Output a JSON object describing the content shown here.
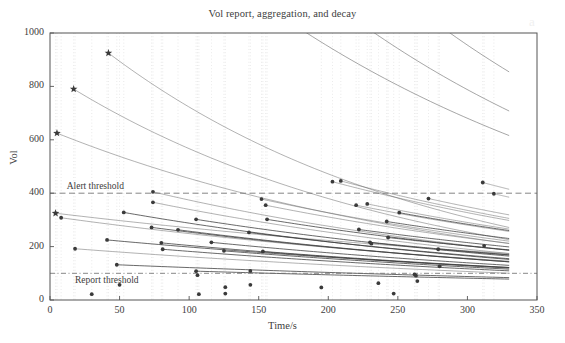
{
  "figure": {
    "title": "Vol report, aggregation, and decay",
    "watermark": "a"
  },
  "axes": {
    "xlabel": "Time/s",
    "ylabel": "Vol",
    "x_ticks": [
      "0",
      "50",
      "100",
      "150",
      "200",
      "250",
      "300",
      "350"
    ],
    "y_ticks": [
      "0",
      "200",
      "400",
      "600",
      "800",
      "1000"
    ]
  },
  "annotations": {
    "alert": "Alert threshold",
    "report": "Report threshold"
  },
  "colors": {
    "axis": "#555555",
    "curve": "#6b6b6b",
    "curve_dark": "#3a3a3a",
    "marker": "#3a3a3a",
    "grid": "#dddddd",
    "threshold": "#707070",
    "background": "#ffffff"
  },
  "chart_data": {
    "type": "line",
    "title": "Vol report, aggregation, and decay",
    "xlabel": "Time/s",
    "ylabel": "Vol",
    "xlim": [
      0,
      350
    ],
    "ylim": [
      0,
      1000
    ],
    "xticks": [
      0,
      50,
      100,
      150,
      200,
      250,
      300,
      350
    ],
    "yticks": [
      0,
      200,
      400,
      600,
      800,
      1000
    ],
    "grid": "vertical dotted gridlines at each report time",
    "legend": "none",
    "curve_end_x": 330,
    "thresholds": [
      {
        "name": "Alert threshold",
        "value": 400,
        "style": "dashed",
        "label_x": 12,
        "label_y": 425
      },
      {
        "name": "Report threshold",
        "value": 100,
        "style": "dashdot",
        "label_x": 18,
        "label_y": 72
      }
    ],
    "decay_model": "each report adds volume which then decays; curves are cumulative aggregated decay traces",
    "star_reports": [
      {
        "x": 4,
        "y": 325
      },
      {
        "x": 17,
        "y": 790
      },
      {
        "x": 42,
        "y": 925
      },
      {
        "x": 5,
        "y": 625
      }
    ],
    "report_points": [
      {
        "x": 4,
        "y": 325
      },
      {
        "x": 8,
        "y": 308
      },
      {
        "x": 5,
        "y": 625
      },
      {
        "x": 17,
        "y": 790
      },
      {
        "x": 18,
        "y": 192
      },
      {
        "x": 30,
        "y": 22
      },
      {
        "x": 42,
        "y": 925
      },
      {
        "x": 41,
        "y": 225
      },
      {
        "x": 48,
        "y": 132
      },
      {
        "x": 50,
        "y": 57
      },
      {
        "x": 53,
        "y": 328
      },
      {
        "x": 73,
        "y": 272
      },
      {
        "x": 74,
        "y": 405
      },
      {
        "x": 74,
        "y": 366
      },
      {
        "x": 80,
        "y": 214
      },
      {
        "x": 81,
        "y": 190
      },
      {
        "x": 92,
        "y": 263
      },
      {
        "x": 105,
        "y": 302
      },
      {
        "x": 105,
        "y": 108
      },
      {
        "x": 106,
        "y": 93
      },
      {
        "x": 107,
        "y": 22
      },
      {
        "x": 116,
        "y": 216
      },
      {
        "x": 125,
        "y": 184
      },
      {
        "x": 126,
        "y": 48
      },
      {
        "x": 126,
        "y": 24
      },
      {
        "x": 143,
        "y": 253
      },
      {
        "x": 144,
        "y": 109
      },
      {
        "x": 144,
        "y": 57
      },
      {
        "x": 152,
        "y": 378
      },
      {
        "x": 153,
        "y": 182
      },
      {
        "x": 155,
        "y": 355
      },
      {
        "x": 156,
        "y": 302
      },
      {
        "x": 195,
        "y": 47
      },
      {
        "x": 203,
        "y": 443
      },
      {
        "x": 209,
        "y": 446
      },
      {
        "x": 220,
        "y": 355
      },
      {
        "x": 222,
        "y": 264
      },
      {
        "x": 228,
        "y": 360
      },
      {
        "x": 230,
        "y": 216
      },
      {
        "x": 231,
        "y": 211
      },
      {
        "x": 236,
        "y": 63
      },
      {
        "x": 242,
        "y": 294
      },
      {
        "x": 243,
        "y": 234
      },
      {
        "x": 247,
        "y": 24
      },
      {
        "x": 251,
        "y": 327
      },
      {
        "x": 262,
        "y": 96
      },
      {
        "x": 263,
        "y": 91
      },
      {
        "x": 264,
        "y": 71
      },
      {
        "x": 272,
        "y": 380
      },
      {
        "x": 279,
        "y": 190
      },
      {
        "x": 280,
        "y": 126
      },
      {
        "x": 311,
        "y": 440
      },
      {
        "x": 312,
        "y": 203
      },
      {
        "x": 319,
        "y": 398
      }
    ],
    "curves": [
      {
        "x0": 4,
        "y0": 325,
        "decay_tau": 520
      },
      {
        "x0": 5,
        "y0": 625,
        "decay_tau": 300
      },
      {
        "x0": 8,
        "y0": 308,
        "decay_tau": 430
      },
      {
        "x0": 17,
        "y0": 790,
        "decay_tau": 250
      },
      {
        "x0": 18,
        "y0": 192,
        "decay_tau": 480
      },
      {
        "x0": 41,
        "y0": 225,
        "decay_tau": 470
      },
      {
        "x0": 42,
        "y0": 925,
        "decay_tau": 235
      },
      {
        "x0": 48,
        "y0": 132,
        "decay_tau": 620
      },
      {
        "x0": 53,
        "y0": 328,
        "decay_tau": 360
      },
      {
        "x0": 73,
        "y0": 272,
        "decay_tau": 400
      },
      {
        "x0": 74,
        "y0": 405,
        "decay_tau": 330
      },
      {
        "x0": 74,
        "y0": 366,
        "decay_tau": 345
      },
      {
        "x0": 80,
        "y0": 214,
        "decay_tau": 430
      },
      {
        "x0": 81,
        "y0": 190,
        "decay_tau": 450
      },
      {
        "x0": 92,
        "y0": 263,
        "decay_tau": 390
      },
      {
        "x0": 105,
        "y0": 302,
        "decay_tau": 370
      },
      {
        "x0": 105,
        "y0": 108,
        "decay_tau": 700
      },
      {
        "x0": 116,
        "y0": 216,
        "decay_tau": 420
      },
      {
        "x0": 125,
        "y0": 184,
        "decay_tau": 440
      },
      {
        "x0": 143,
        "y0": 253,
        "decay_tau": 380
      },
      {
        "x0": 152,
        "y0": 378,
        "decay_tau": 330
      },
      {
        "x0": 153,
        "y0": 182,
        "decay_tau": 440
      },
      {
        "x0": 155,
        "y0": 355,
        "decay_tau": 340
      },
      {
        "x0": 156,
        "y0": 302,
        "decay_tau": 360
      },
      {
        "x0": 203,
        "y0": 443,
        "decay_tau": 320
      },
      {
        "x0": 209,
        "y0": 446,
        "decay_tau": 320
      },
      {
        "x0": 220,
        "y0": 355,
        "decay_tau": 340
      },
      {
        "x0": 222,
        "y0": 264,
        "decay_tau": 380
      },
      {
        "x0": 228,
        "y0": 360,
        "decay_tau": 335
      },
      {
        "x0": 230,
        "y0": 216,
        "decay_tau": 410
      },
      {
        "x0": 242,
        "y0": 294,
        "decay_tau": 360
      },
      {
        "x0": 243,
        "y0": 234,
        "decay_tau": 395
      },
      {
        "x0": 251,
        "y0": 327,
        "decay_tau": 345
      },
      {
        "x0": 272,
        "y0": 380,
        "decay_tau": 330
      },
      {
        "x0": 279,
        "y0": 190,
        "decay_tau": 430
      },
      {
        "x0": 311,
        "y0": 440,
        "decay_tau": 320
      },
      {
        "x0": 319,
        "y0": 398,
        "decay_tau": 330
      }
    ],
    "background_curves_from_top": [
      {
        "y_at_x0": 1850,
        "decay_tau": 300
      },
      {
        "y_at_x0": 2300,
        "decay_tau": 280
      },
      {
        "y_at_x0": 2900,
        "decay_tau": 270
      },
      {
        "y_at_x0": 3600,
        "decay_tau": 260
      },
      {
        "y_at_x0": 4400,
        "decay_tau": 250
      },
      {
        "y_at_x0": 5400,
        "decay_tau": 245
      },
      {
        "y_at_x0": 6600,
        "decay_tau": 240
      },
      {
        "y_at_x0": 8000,
        "decay_tau": 235
      },
      {
        "y_at_x0": 9800,
        "decay_tau": 230
      },
      {
        "y_at_x0": 12000,
        "decay_tau": 225
      }
    ]
  }
}
